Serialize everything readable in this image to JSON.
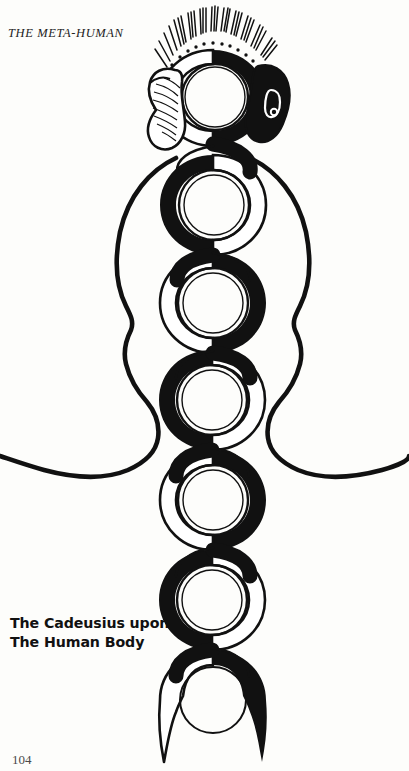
{
  "page": {
    "width": 409,
    "height": 771,
    "background_color": "#fdfdfb",
    "ink_color": "#111111",
    "running_head": "THE META-HUMAN",
    "folio": "104"
  },
  "caption": {
    "line1": "The Cadeusius upon",
    "line2": "The Human Body"
  },
  "figure": {
    "name": "caduceus-upon-human-body",
    "body_outline_color": "#111111",
    "serpent_fill_color": "#111111",
    "ring_stroke_color": "#111111",
    "axis_x": 213,
    "chakras": [
      {
        "label": "crown",
        "cx": 215,
        "cy": 97,
        "outer_r": 47,
        "ring_r": 33,
        "inner_r": 30,
        "crescent_side": "right"
      },
      {
        "label": "third-eye",
        "cx": 215,
        "cy": 205,
        "outer_r": 50,
        "ring_r": 35,
        "inner_r": 30,
        "crescent_side": "left"
      },
      {
        "label": "throat",
        "cx": 213,
        "cy": 303,
        "outer_r": 50,
        "ring_r": 35,
        "inner_r": 30,
        "crescent_side": "right"
      },
      {
        "label": "heart",
        "cx": 212,
        "cy": 400,
        "outer_r": 50,
        "ring_r": 35,
        "inner_r": 30,
        "crescent_side": "left"
      },
      {
        "label": "solar-plexus",
        "cx": 213,
        "cy": 500,
        "outer_r": 50,
        "ring_r": 35,
        "inner_r": 30,
        "crescent_side": "right"
      },
      {
        "label": "sacral",
        "cx": 212,
        "cy": 600,
        "outer_r": 50,
        "ring_r": 35,
        "inner_r": 30,
        "crescent_side": "left"
      },
      {
        "label": "root",
        "cx": 213,
        "cy": 700,
        "outer_r": 50,
        "ring_r": 35,
        "inner_r": 30,
        "crescent_side": "right"
      }
    ],
    "serpent_heads": [
      {
        "side": "left",
        "fill": "white",
        "note": "outlined hooded serpent head with hatched scales"
      },
      {
        "side": "right",
        "fill": "black",
        "note": "solid black serpent head with light eye marking"
      }
    ],
    "crown_rays": {
      "count": 46,
      "note": "radiating hair-like rays above the crown chakra"
    }
  }
}
